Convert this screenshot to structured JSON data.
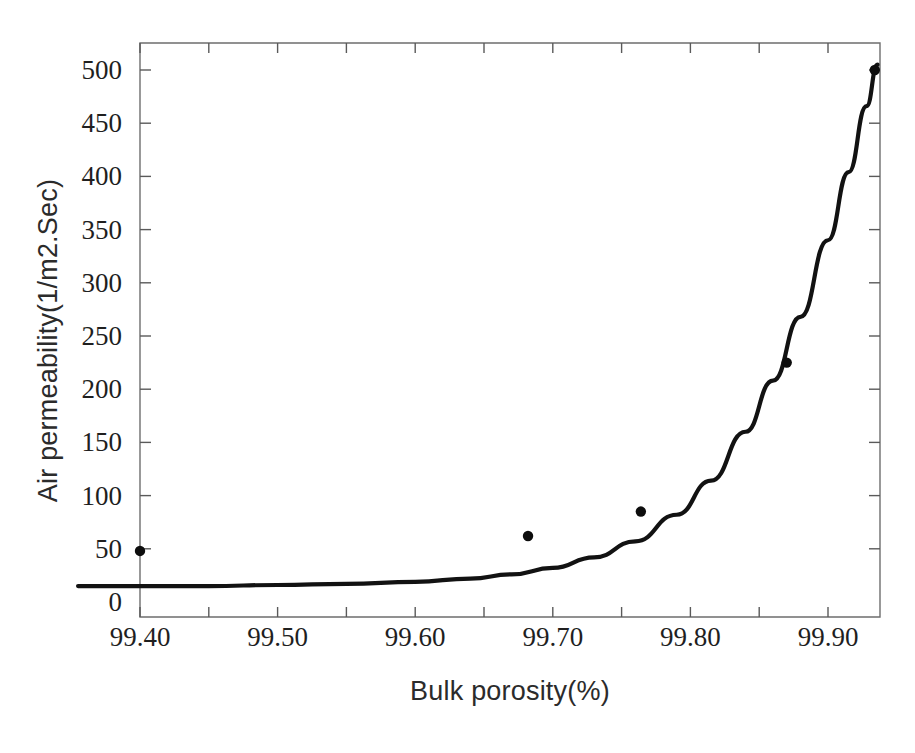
{
  "chart_data": {
    "type": "scatter",
    "title": "",
    "subtitle": "",
    "xlabel": "Bulk porosity(%)",
    "ylabel": "Air permeability(1/m2.Sec)",
    "xlim": [
      99.355,
      99.94
    ],
    "ylim": [
      0,
      540
    ],
    "xticks": [
      99.4,
      99.5,
      99.6,
      99.7,
      99.8,
      99.9
    ],
    "xtick_labels": [
      "99.40",
      "99.50",
      "99.60",
      "99.70",
      "99.80",
      "99.90"
    ],
    "yticks": [
      0,
      50,
      100,
      150,
      200,
      250,
      300,
      350,
      400,
      450,
      500
    ],
    "ytick_labels": [
      "0",
      "50",
      "100",
      "150",
      "200",
      "250",
      "300",
      "350",
      "400",
      "450",
      "500"
    ],
    "grid": false,
    "legend": null,
    "legend_position": "none",
    "annotations": [],
    "series": [
      {
        "name": "Measured data",
        "type": "scatter",
        "marker": "circle",
        "color": "#0d0d0d",
        "points": [
          {
            "x": 99.4,
            "y": 48
          },
          {
            "x": 99.682,
            "y": 62
          },
          {
            "x": 99.764,
            "y": 85
          },
          {
            "x": 99.87,
            "y": 225
          },
          {
            "x": 99.934,
            "y": 500
          }
        ]
      },
      {
        "name": "Fitted exponential curve",
        "type": "line",
        "color": "#121212",
        "points": [
          {
            "x": 99.355,
            "y": 15
          },
          {
            "x": 99.4,
            "y": 15
          },
          {
            "x": 99.45,
            "y": 15
          },
          {
            "x": 99.5,
            "y": 16
          },
          {
            "x": 99.55,
            "y": 17
          },
          {
            "x": 99.6,
            "y": 19
          },
          {
            "x": 99.64,
            "y": 22
          },
          {
            "x": 99.67,
            "y": 26
          },
          {
            "x": 99.7,
            "y": 32
          },
          {
            "x": 99.73,
            "y": 42
          },
          {
            "x": 99.76,
            "y": 57
          },
          {
            "x": 99.79,
            "y": 82
          },
          {
            "x": 99.815,
            "y": 114
          },
          {
            "x": 99.84,
            "y": 160
          },
          {
            "x": 99.86,
            "y": 208
          },
          {
            "x": 99.88,
            "y": 268
          },
          {
            "x": 99.9,
            "y": 340
          },
          {
            "x": 99.915,
            "y": 404
          },
          {
            "x": 99.928,
            "y": 466
          },
          {
            "x": 99.936,
            "y": 505
          }
        ]
      }
    ]
  },
  "axes": {
    "x_label": "Bulk porosity(%)",
    "y_label": "Air permeability(1/m2.Sec)"
  }
}
